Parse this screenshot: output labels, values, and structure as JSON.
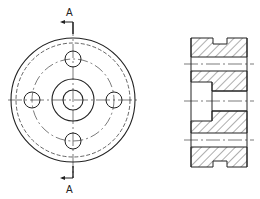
{
  "drawing": {
    "type": "technical-drawing",
    "views": [
      {
        "name": "front-view",
        "description": "Circular flange with central hub, bore and four bolt holes"
      },
      {
        "name": "section-view",
        "description": "Section A-A showing hatched cross-section"
      }
    ],
    "section_labels": {
      "top": "A",
      "bottom": "A"
    },
    "colors": {
      "line": "#222222",
      "background": "#ffffff"
    }
  }
}
